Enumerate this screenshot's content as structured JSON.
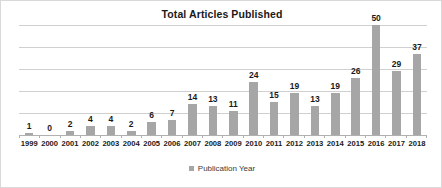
{
  "chart_data": {
    "type": "bar",
    "title": "Total Articles Published",
    "xlabel": "",
    "ylabel": "",
    "ylim": [
      0,
      50
    ],
    "grid": true,
    "gridline_values": [
      0,
      10,
      20,
      30,
      40,
      50
    ],
    "legend": {
      "position": "bottom",
      "entries": [
        {
          "name": "Publication Year",
          "color": "#a6a6a6",
          "marker": "square"
        }
      ]
    },
    "series_color": "#a6a6a6",
    "categories": [
      "1999",
      "2000",
      "2001",
      "2002",
      "2003",
      "2004",
      "2005",
      "2006",
      "2007",
      "2008",
      "2009",
      "2010",
      "2011",
      "2012",
      "2013",
      "2014",
      "2015",
      "2016",
      "2017",
      "2018"
    ],
    "series": [
      {
        "name": "Publication Year",
        "values": [
          1,
          0,
          2,
          4,
          4,
          2,
          6,
          7,
          14,
          13,
          11,
          24,
          15,
          19,
          13,
          19,
          26,
          50,
          29,
          37
        ]
      }
    ],
    "data_labels": [
      "1",
      "0",
      "2",
      "4",
      "4",
      "2",
      "6",
      "7",
      "14",
      "13",
      "11",
      "24",
      "15",
      "19",
      "13",
      "19",
      "26",
      "50",
      "29",
      "37"
    ]
  },
  "colors": {
    "bar": "#a6a6a6",
    "gridline": "#d0d0d0",
    "baseline": "#b0b0b0",
    "border": "#d9d9d9",
    "text": "#1a1a1a",
    "legend_text": "#3a3a3a"
  }
}
